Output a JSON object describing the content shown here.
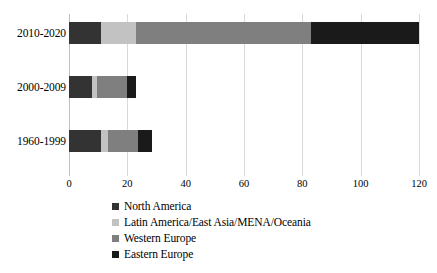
{
  "chart_data": {
    "type": "bar",
    "orientation": "horizontal",
    "stacked": true,
    "title": "",
    "xlabel": "",
    "ylabel": "",
    "xlim": [
      0,
      120
    ],
    "xticks": [
      0,
      20,
      40,
      60,
      80,
      100,
      120
    ],
    "grid": "vertical",
    "legend_position": "bottom",
    "categories": [
      "2010-2020",
      "2000-2009",
      "1960-1999"
    ],
    "series": [
      {
        "name": "North America",
        "color": "#333333",
        "values": [
          11,
          8,
          11
        ]
      },
      {
        "name": "Latin America/East Asia/MENA/Oceania",
        "color": "#c2c2c2",
        "values": [
          12,
          1.5,
          2.5
        ]
      },
      {
        "name": "Western Europe",
        "color": "#7f7f7f",
        "values": [
          60,
          10.5,
          10
        ]
      },
      {
        "name": "Eastern Europe",
        "color": "#1a1a1a",
        "values": [
          37,
          3,
          5
        ]
      }
    ],
    "totals": [
      120,
      23,
      28.5
    ]
  },
  "axis": {
    "tick_labels": [
      "0",
      "20",
      "40",
      "60",
      "80",
      "100",
      "120"
    ]
  },
  "legend": {
    "items": [
      {
        "label": "North America",
        "color": "#333333"
      },
      {
        "label": "Latin America/East Asia/MENA/Oceania",
        "color": "#c2c2c2"
      },
      {
        "label": "Western Europe",
        "color": "#7f7f7f"
      },
      {
        "label": "Eastern Europe",
        "color": "#1a1a1a"
      }
    ]
  },
  "colors": {
    "gridline": "#d9d9d9",
    "axis": "#bfbfbf",
    "background": "#ffffff",
    "text": "#000000"
  }
}
